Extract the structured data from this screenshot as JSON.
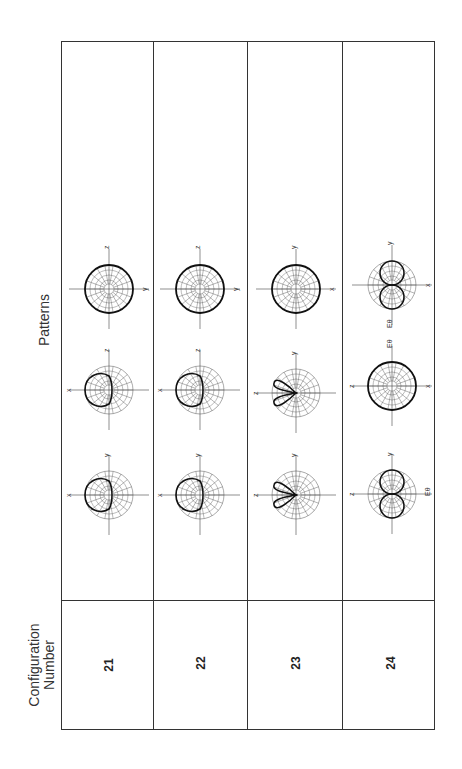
{
  "headers": {
    "configuration": "Configuration\nNumber",
    "configuration_line1": "Configuration",
    "configuration_line2": "Number",
    "patterns": "Patterns"
  },
  "rows": [
    {
      "config_number": "21",
      "patterns": [
        {
          "shape": "single-lobe",
          "labels": {
            "left": "x",
            "top": "y"
          }
        },
        {
          "shape": "single-lobe",
          "labels": {
            "left": "x",
            "top": "z"
          }
        },
        {
          "shape": "circle",
          "labels": {
            "top": "z",
            "right": "y"
          }
        }
      ]
    },
    {
      "config_number": "22",
      "patterns": [
        {
          "shape": "single-lobe",
          "labels": {
            "left": "x",
            "top": "y"
          }
        },
        {
          "shape": "single-lobe",
          "labels": {
            "left": "x",
            "top": "z"
          }
        },
        {
          "shape": "circle",
          "labels": {
            "top": "z",
            "right": "y"
          }
        }
      ]
    },
    {
      "config_number": "23",
      "patterns": [
        {
          "shape": "two-lobe",
          "labels": {
            "left": "z",
            "top": "y"
          }
        },
        {
          "shape": "two-lobe",
          "labels": {
            "left": "z",
            "top": "y"
          }
        },
        {
          "shape": "circle",
          "labels": {
            "top": "y",
            "right": "x"
          }
        }
      ]
    },
    {
      "config_number": "24",
      "patterns": [
        {
          "shape": "figure-eight",
          "labels": {
            "left": "z",
            "top": "y",
            "right": "Eθ"
          }
        },
        {
          "shape": "circle",
          "labels": {
            "left": "z",
            "top": "Eθ",
            "right": "x"
          }
        },
        {
          "shape": "figure-eight",
          "labels": {
            "top": "y",
            "right": "x",
            "bottom": "Eθ"
          }
        }
      ]
    }
  ],
  "colors": {
    "line": "#333333",
    "grid": "#555555",
    "background": "#ffffff"
  }
}
